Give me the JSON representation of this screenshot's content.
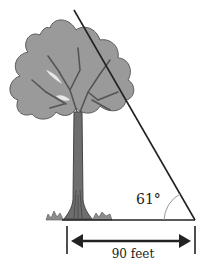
{
  "diagram": {
    "type": "right-triangle-trig",
    "angle_label": "61°",
    "distance_label": "90 feet",
    "colors": {
      "line": "#222222",
      "foliage": "#9a9a9a",
      "foliage_edge": "#5a5a5a",
      "trunk": "#6e6e6e",
      "angle_arc": "#999999",
      "grass": "#8c8c8c"
    }
  }
}
